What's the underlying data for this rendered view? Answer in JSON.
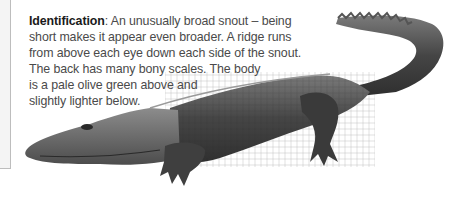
{
  "caption": {
    "heading": "Identification",
    "separator": ": ",
    "lines": [
      "An unusually broad snout – being",
      "short makes it appear even broader. A ridge runs",
      "from above each eye down each side of the snout.",
      "The back has many bony scales. The body",
      "is a pale olive green above and",
      "slightly lighter below."
    ]
  },
  "image": {
    "subject": "crocodile-illustration",
    "colors": {
      "dark": "#3a3a3a",
      "mid": "#6b6b6b",
      "light": "#9a9a9a"
    }
  }
}
